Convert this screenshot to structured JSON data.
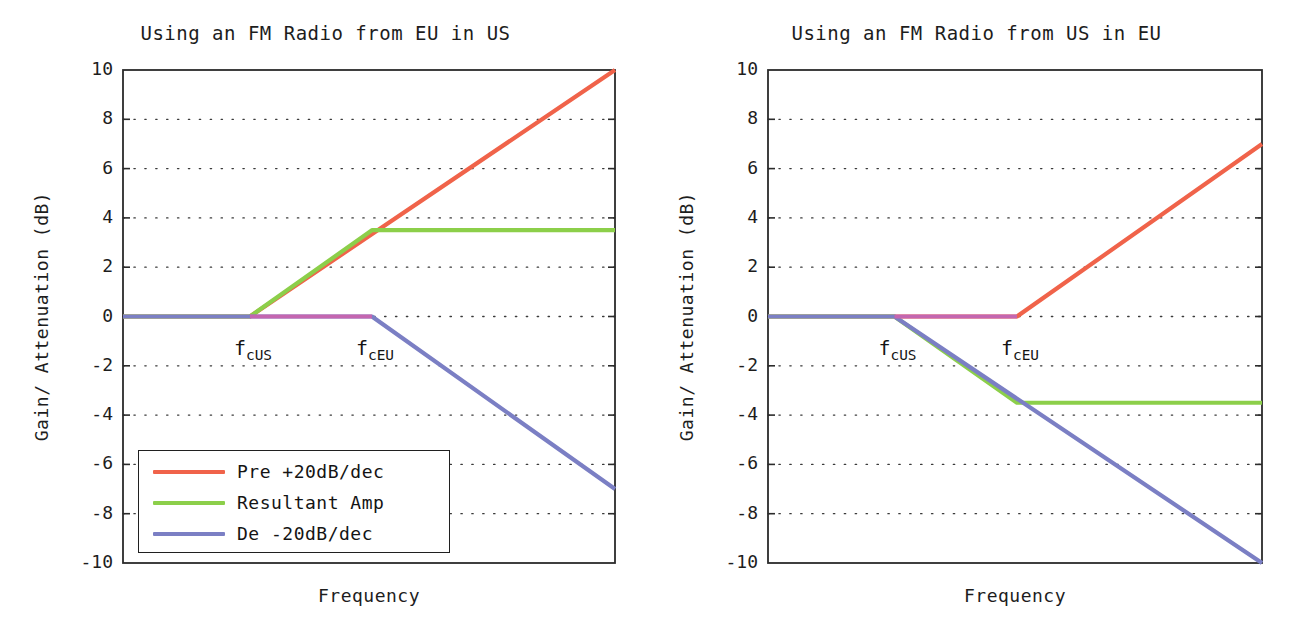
{
  "figure": {
    "width": 1302,
    "height": 633,
    "background": "#ffffff"
  },
  "colors": {
    "pre_emphasis": "#f0634a",
    "resultant": "#8ccf4a",
    "de_emphasis": "#7b7fc4",
    "overlap_flat": "#c466b0",
    "axis": "#2b2b2b",
    "grid": "#3a3a3a",
    "text": "#1a1a1a"
  },
  "legend": {
    "position": "lower-left",
    "entries": [
      {
        "label": "Pre +20dB/dec",
        "color": "#f0634a"
      },
      {
        "label": "Resultant Amp",
        "color": "#8ccf4a"
      },
      {
        "label": "De -20dB/dec",
        "color": "#7b7fc4"
      }
    ]
  },
  "chart_data": [
    {
      "type": "line",
      "id": "eu-radio-in-us",
      "title": "Using an FM Radio from EU in US",
      "xlabel": "Frequency",
      "ylabel": "Gain/ Attenuation (dB)",
      "xlim": [
        0,
        1
      ],
      "ylim": [
        -10,
        10
      ],
      "grid": true,
      "grid_style": "dotted",
      "yticks": [
        10,
        8,
        6,
        4,
        2,
        0,
        -2,
        -4,
        -6,
        -8,
        -10
      ],
      "ytick_labels": [
        "10",
        "8",
        "6",
        "4",
        "2",
        "0",
        "-2",
        "-4",
        "-6",
        "-8",
        "-10"
      ],
      "xticks": [],
      "xtick_labels": [],
      "annotations": [
        {
          "text": "f",
          "sub": "cUS",
          "x": 0.258,
          "y": -0.95,
          "name": "f-cus-label"
        },
        {
          "text": "f",
          "sub": "cEU",
          "x": 0.506,
          "y": -0.95,
          "name": "f-ceu-label"
        }
      ],
      "breakpoints": {
        "f_cUS": 0.258,
        "f_cEU": 0.506
      },
      "series": [
        {
          "name": "Pre +20dB/dec",
          "color": "#f0634a",
          "x": [
            0.0,
            0.258,
            1.0
          ],
          "y": [
            0.0,
            0.0,
            10.0
          ]
        },
        {
          "name": "Resultant Amp",
          "color": "#8ccf4a",
          "x": [
            0.0,
            0.258,
            0.506,
            1.0
          ],
          "y": [
            0.0,
            0.0,
            3.5,
            3.5
          ]
        },
        {
          "name": "De -20dB/dec",
          "color": "#7b7fc4",
          "x": [
            0.0,
            0.506,
            1.0
          ],
          "y": [
            0.0,
            0.0,
            -7.0
          ]
        }
      ]
    },
    {
      "type": "line",
      "id": "us-radio-in-eu",
      "title": "Using an FM Radio from US in EU",
      "xlabel": "Frequency",
      "ylabel": "Gain/ Attenuation (dB)",
      "xlim": [
        0,
        1
      ],
      "ylim": [
        -10,
        10
      ],
      "grid": true,
      "grid_style": "dotted",
      "yticks": [
        10,
        8,
        6,
        4,
        2,
        0,
        -2,
        -4,
        -6,
        -8,
        -10
      ],
      "ytick_labels": [
        "10",
        "8",
        "6",
        "4",
        "2",
        "0",
        "-2",
        "-4",
        "-6",
        "-8",
        "-10"
      ],
      "xticks": [],
      "xtick_labels": [],
      "annotations": [
        {
          "text": "f",
          "sub": "cUS",
          "x": 0.256,
          "y": -0.95,
          "name": "f-cus-label"
        },
        {
          "text": "f",
          "sub": "cEU",
          "x": 0.504,
          "y": -0.95,
          "name": "f-ceu-label"
        }
      ],
      "breakpoints": {
        "f_cUS": 0.256,
        "f_cEU": 0.504
      },
      "series": [
        {
          "name": "Pre +20dB/dec",
          "color": "#f0634a",
          "x": [
            0.0,
            0.504,
            1.0
          ],
          "y": [
            0.0,
            0.0,
            7.0
          ]
        },
        {
          "name": "Resultant Amp",
          "color": "#8ccf4a",
          "x": [
            0.0,
            0.256,
            0.504,
            1.0
          ],
          "y": [
            0.0,
            0.0,
            -3.5,
            -3.5
          ]
        },
        {
          "name": "De -20dB/dec",
          "color": "#7b7fc4",
          "x": [
            0.0,
            0.256,
            1.0
          ],
          "y": [
            0.0,
            0.0,
            -10.0
          ]
        }
      ]
    }
  ]
}
